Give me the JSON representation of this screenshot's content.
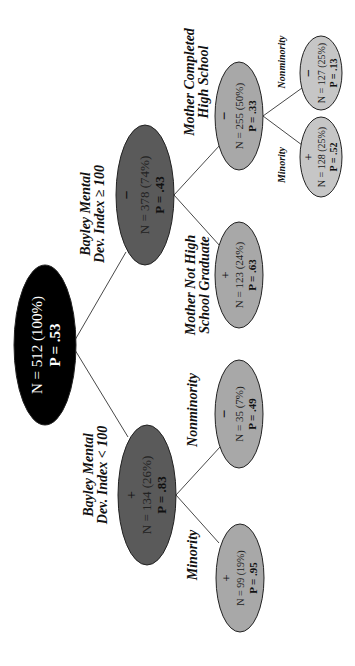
{
  "diagram": {
    "type": "decision-tree",
    "orientation": "rotated-90-ccw",
    "colors": {
      "root_fill": "#000000",
      "level1_fill": "#5a5a5a",
      "level2_fill": "#a8a8a8",
      "level3_fill": "#c6c6c6",
      "edge": "#333333"
    },
    "nodes": {
      "root": {
        "sign": "",
        "n_text": "N = 512 (100%)",
        "p_text": "P = .53"
      },
      "bmdi_hi": {
        "sign": "−",
        "n_text": "N = 378 (74%)",
        "p_text": "P = .43"
      },
      "bmdi_lo": {
        "sign": "+",
        "n_text": "N = 134 (26%)",
        "p_text": "P = .83"
      },
      "mom_hs": {
        "sign": "−",
        "n_text": "N = 255 (50%)",
        "p_text": "P = .33"
      },
      "mom_nohs": {
        "sign": "+",
        "n_text": "N = 123 (24%)",
        "p_text": "P = .63"
      },
      "lo_nonmin": {
        "sign": "−",
        "n_text": "N = 35 (7%)",
        "p_text": "P = .49"
      },
      "lo_min": {
        "sign": "+",
        "n_text": "N = 99 (19%)",
        "p_text": "P = .95"
      },
      "hs_min": {
        "sign": "+",
        "n_text": "N = 128 (25%)",
        "p_text": "P = .52"
      },
      "hs_nonmin": {
        "sign": "−",
        "n_text": "N = 127 (25%)",
        "p_text": "P = .13"
      }
    },
    "labels": {
      "bmdi_hi_l1": "Bayley Mental",
      "bmdi_hi_l2": "Dev. Index ≥ 100",
      "bmdi_lo_l1": "Bayley Mental",
      "bmdi_lo_l2": "Dev. Index < 100",
      "mom_hs_l1": "Mother Completed",
      "mom_hs_l2": "High School",
      "mom_nohs_l1": "Mother Not High",
      "mom_nohs_l2": "School Graduate",
      "lo_nonmin": "Nonminority",
      "lo_min": "Minority",
      "hs_min": "Minority",
      "hs_nonmin": "Nonminority"
    }
  }
}
